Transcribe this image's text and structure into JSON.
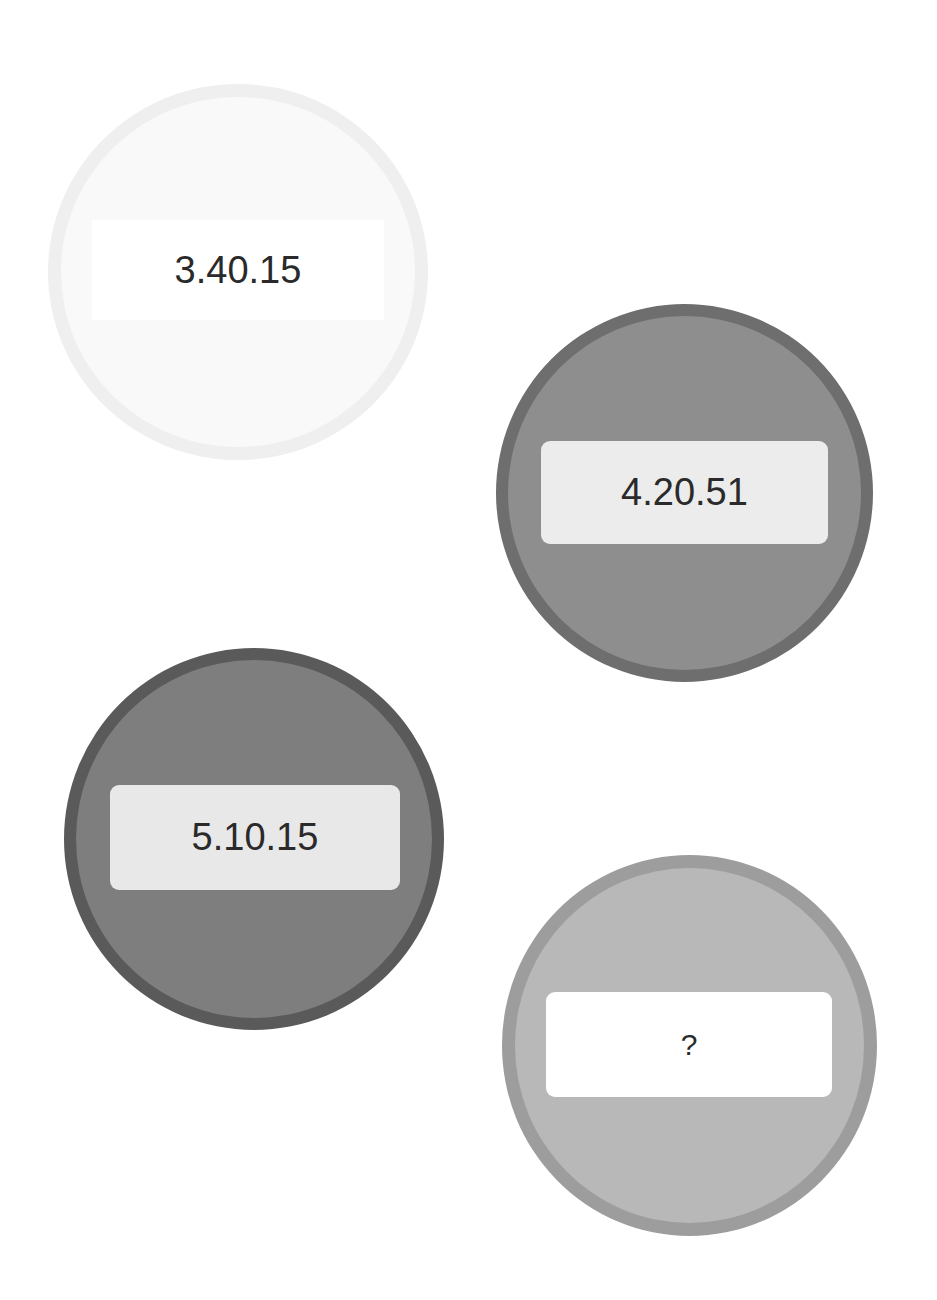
{
  "puzzle": {
    "items": [
      {
        "label": "3.40.15",
        "fill_color": "#f9f9f9",
        "ring_color": "#efefef",
        "label_bg": "#ffffff"
      },
      {
        "label": "4.20.51",
        "fill_color": "#8e8e8e",
        "ring_color": "#6e6e6e",
        "label_bg": "#ececec"
      },
      {
        "label": "5.10.15",
        "fill_color": "#7e7e7e",
        "ring_color": "#5a5a5a",
        "label_bg": "#e8e8e8"
      },
      {
        "label": "?",
        "fill_color": "#b8b8b8",
        "ring_color": "#9d9d9d",
        "label_bg": "#ffffff"
      }
    ]
  }
}
